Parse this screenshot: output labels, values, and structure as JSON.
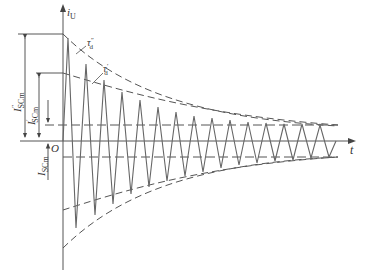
{
  "diagram": {
    "type": "short-circuit current waveform",
    "axes": {
      "y_label": "i",
      "y_label_sub": "U",
      "x_label": "t",
      "origin": "O"
    },
    "envelopes": {
      "subtransient": {
        "label": "τ",
        "label_sub": "d",
        "label_sup": "″"
      },
      "transient": {
        "label": "τ",
        "label_sub": "d",
        "label_sup": "′"
      }
    },
    "dimensions": {
      "subtransient_peak": {
        "label": "I",
        "label_sup": "″",
        "label_sub": "SCm"
      },
      "transient_peak": {
        "label": "I",
        "label_sup": "′",
        "label_sub": "SCm"
      },
      "steady_peak": {
        "label": "I",
        "label_sub": "SCm"
      }
    },
    "colors": {
      "line": "#555555",
      "dashed": "#555555"
    }
  }
}
